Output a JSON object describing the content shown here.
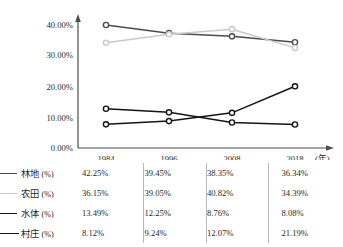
{
  "chart_data": {
    "type": "line",
    "title": "",
    "subtitle": "",
    "xlabel": "(年)",
    "ylabel": "",
    "categories": [
      "1984",
      "1996",
      "2008",
      "2018"
    ],
    "x": [
      1984,
      1996,
      2008,
      2018
    ],
    "ylim": [
      0,
      45
    ],
    "y_ticks": [
      0,
      10,
      20,
      30,
      40
    ],
    "y_tick_labels": [
      "0.00%",
      "10.00%",
      "20.00%",
      "30.00%",
      "40.00%"
    ],
    "grid": false,
    "legend_position": "bottom-table",
    "marker": "open-circle",
    "series": [
      {
        "name": "林地 (%)",
        "label_name": "林地",
        "label_unit": "(%)",
        "color": "#4a4a52",
        "values": [
          42.25,
          39.45,
          38.35,
          36.34
        ],
        "value_labels": [
          "42.25%",
          "39.45%",
          "38.35%",
          "36.34%"
        ]
      },
      {
        "name": "农田 (%)",
        "label_name": "农田",
        "label_unit": "(%)",
        "color": "#c9c9c9",
        "values": [
          36.15,
          39.05,
          40.82,
          34.39
        ],
        "value_labels": [
          "36.15%",
          "39.05%",
          "40.82%",
          "34.39%"
        ]
      },
      {
        "name": "水体 (%)",
        "label_name": "水体",
        "label_unit": "(%)",
        "color": "#141414",
        "values": [
          13.49,
          12.25,
          8.76,
          8.08
        ],
        "value_labels": [
          "13.49%",
          "12.25%",
          "8.76%",
          "8.08%"
        ]
      },
      {
        "name": "村庄 (%)",
        "label_name": "村庄",
        "label_unit": "(%)",
        "color": "#141414",
        "values": [
          8.12,
          9.24,
          12.07,
          21.19
        ],
        "value_labels": [
          "8.12%",
          "9.24%",
          "12.07%",
          "21.19%"
        ]
      }
    ]
  },
  "axis": {
    "y_labels": [
      "40.00%",
      "30.00%",
      "20.00%",
      "10.00%",
      "0.00%"
    ],
    "x_labels": [
      "1984",
      "1996",
      "2008",
      "2018"
    ],
    "x_unit": "(年)"
  },
  "legend": {
    "rows": [
      {
        "name": "林地",
        "unit": "(%)",
        "color": "#4a4a52",
        "values": [
          "42.25%",
          "39.45%",
          "38.35%",
          "36.34%"
        ]
      },
      {
        "name": "农田",
        "unit": "(%)",
        "color": "#c9c9c9",
        "values": [
          "36.15%",
          "39.05%",
          "40.82%",
          "34.39%"
        ]
      },
      {
        "name": "水体",
        "unit": "(%)",
        "color": "#141414",
        "values": [
          "13.49%",
          "12.25%",
          "8.76%",
          "8.08%"
        ]
      },
      {
        "name": "村庄",
        "unit": "(%)",
        "color": "#141414",
        "values": [
          "8.12%",
          "9.24%",
          "12.07%",
          "21.19%"
        ]
      }
    ]
  }
}
